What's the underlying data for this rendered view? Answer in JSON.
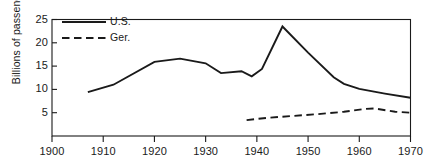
{
  "chart_data": {
    "type": "line",
    "title": "",
    "subtitle": "",
    "xlabel": "",
    "ylabel": "Billions of passengers",
    "xlim": [
      1900,
      1970
    ],
    "ylim": [
      0,
      25
    ],
    "xticks": [
      1900,
      1910,
      1920,
      1930,
      1940,
      1950,
      1960,
      1970
    ],
    "xticklabels": [
      "1900",
      "1910",
      "1920",
      "1930",
      "1940",
      "1950",
      "1960",
      "1970"
    ],
    "yticks": [
      5,
      10,
      15,
      20,
      25
    ],
    "yticklabels": [
      "5",
      "10",
      "15",
      "20",
      "25"
    ],
    "grid": false,
    "legend_position": "upper-left-inside",
    "series": [
      {
        "name": "U.S.",
        "style": "solid",
        "color": "#1a1a1a",
        "x": [
          1907,
          1912,
          1920,
          1925,
          1930,
          1933,
          1937,
          1939,
          1941,
          1945,
          1950,
          1955,
          1957,
          1960,
          1965,
          1970
        ],
        "y": [
          9.4,
          11.0,
          15.9,
          16.6,
          15.6,
          13.5,
          13.9,
          12.8,
          14.4,
          23.5,
          17.9,
          12.6,
          11.2,
          10.1,
          9.1,
          8.2
        ]
      },
      {
        "name": "Ger.",
        "style": "dashed",
        "color": "#1a1a1a",
        "x": [
          1938,
          1942,
          1947,
          1952,
          1957,
          1961,
          1963,
          1967,
          1970
        ],
        "y": [
          3.4,
          3.9,
          4.3,
          4.7,
          5.2,
          5.8,
          5.9,
          5.2,
          5.0
        ]
      }
    ],
    "legend": [
      {
        "label": "U.S.",
        "style": "solid"
      },
      {
        "label": "Ger.",
        "style": "dashed"
      }
    ]
  }
}
